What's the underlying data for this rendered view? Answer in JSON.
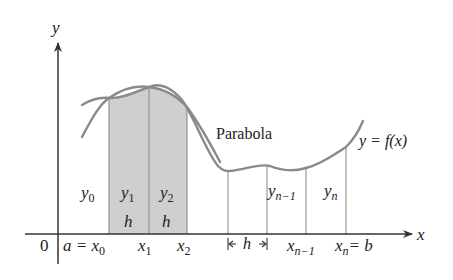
{
  "figure": {
    "type": "simpsons-rule-diagram",
    "colors": {
      "axis": "#333333",
      "curve": "#8a8a8a",
      "shade": "#cfcfcf",
      "shade_edge": "#999999",
      "ordinate": "#9a9a9a",
      "text": "#222222"
    }
  },
  "axes": {
    "x_label": "x",
    "y_label": "y",
    "origin_label": "0"
  },
  "labels": {
    "parabola": "Parabola",
    "function": "y = f(x)",
    "y0": {
      "base": "y",
      "sub": "0"
    },
    "y1": {
      "base": "y",
      "sub": "1"
    },
    "y2": {
      "base": "y",
      "sub": "2"
    },
    "yn1": {
      "base": "y",
      "sub": "n−1"
    },
    "yn": {
      "base": "y",
      "sub": "n"
    },
    "h1": "h",
    "h2": "h",
    "h_interval": "h",
    "a_eq": "a = ",
    "x0": {
      "base": "x",
      "sub": "0"
    },
    "x1": {
      "base": "x",
      "sub": "1"
    },
    "x2": {
      "base": "x",
      "sub": "2"
    },
    "xn1": {
      "base": "x",
      "sub": "n−1"
    },
    "xn": {
      "base": "x",
      "sub": "n"
    },
    "b_eq": "= b"
  }
}
